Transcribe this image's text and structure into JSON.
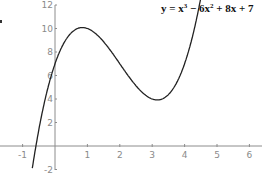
{
  "chart_data": {
    "type": "line",
    "title_display": {
      "base": "y = x",
      "sup1": "3",
      "mid": " − 6x",
      "sup2": "2",
      "tail": " + 8x + 7"
    },
    "xlabel": "",
    "ylabel": "",
    "xlim": [
      -1.7,
      6.2
    ],
    "ylim": [
      -2.3,
      12.3
    ],
    "x_ticks": [
      -1,
      1,
      2,
      3,
      4,
      5,
      6
    ],
    "y_ticks": [
      -2,
      2,
      4,
      6,
      8,
      10,
      12
    ],
    "grid": false,
    "legend": null,
    "series": [
      {
        "name": "y = x^3 - 6x^2 + 8x + 7",
        "function": "x^3 - 6x^2 + 8x + 7",
        "x_range": [
          -0.7,
          4.55
        ],
        "x": [
          -0.7,
          -0.5,
          0,
          0.5,
          0.85,
          1,
          1.5,
          2,
          2.5,
          3,
          3.15,
          3.5,
          4,
          4.5
        ],
        "y": [
          -1.88,
          1.38,
          7,
          9.63,
          10.08,
          10,
          8.88,
          7,
          5.13,
          4,
          3.92,
          4.38,
          7,
          12.63
        ]
      }
    ],
    "annotations": {
      "local_max": {
        "x": 0.85,
        "y": 10.08
      },
      "local_min": {
        "x": 3.15,
        "y": 3.92
      }
    },
    "colors": {
      "curve": "#222222",
      "axes": "#8c8c8c",
      "labels": "#8a8a8a",
      "title": "#111111"
    }
  }
}
